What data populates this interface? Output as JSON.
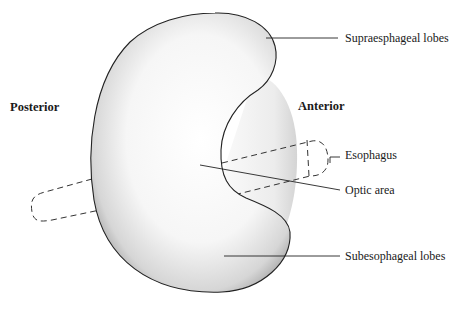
{
  "diagram": {
    "orientation": {
      "posterior": "Posterior",
      "anterior": "Anterior"
    },
    "labels": {
      "supraesophageal": "Supraesphageal lobes",
      "esophagus": "Esophagus",
      "optic": "Optic area",
      "subesophageal": "Subesophageal lobes"
    },
    "colors": {
      "outline": "#222222",
      "fill_light": "#ffffff",
      "fill_shade": "#bdbdbd",
      "anterior_shade": "#e2e2e2",
      "text": "#1a1a1a"
    }
  }
}
